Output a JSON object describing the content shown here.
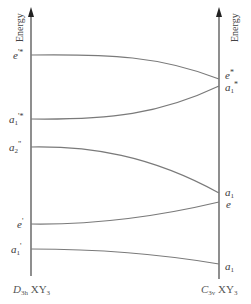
{
  "diagram": {
    "type": "correlation-diagram",
    "axis_title_left": "Energy",
    "axis_title_right": "Energy",
    "left_group": {
      "point_group": "D",
      "point_group_sub": "3h",
      "molecule": "XY",
      "molecule_sub": "3"
    },
    "right_group": {
      "point_group": "C",
      "point_group_sub": "3v",
      "molecule": "XY",
      "molecule_sub": "3"
    },
    "left_levels": [
      {
        "id": "e_prime_star",
        "base": "e",
        "sub": "",
        "sup": "'*",
        "y": 55
      },
      {
        "id": "a1_prime_star",
        "base": "a",
        "sub": "1",
        "sup": "'*",
        "y": 119
      },
      {
        "id": "a2_dprime",
        "base": "a",
        "sub": "2",
        "sup": "\"",
        "y": 147
      },
      {
        "id": "e_prime",
        "base": "e",
        "sub": "",
        "sup": "'",
        "y": 224
      },
      {
        "id": "a1_prime",
        "base": "a",
        "sub": "1",
        "sup": "'",
        "y": 249
      }
    ],
    "right_levels": [
      {
        "id": "e_star",
        "base": "e",
        "sub": "",
        "sup": "*",
        "y": 79
      },
      {
        "id": "a1_star",
        "base": "a",
        "sub": "1",
        "sup": "*",
        "y": 86
      },
      {
        "id": "a1_upper",
        "base": "a",
        "sub": "1",
        "sup": "",
        "y": 193
      },
      {
        "id": "e",
        "base": "e",
        "sub": "",
        "sup": "",
        "y": 202
      },
      {
        "id": "a1_lower",
        "base": "a",
        "sub": "1",
        "sup": "",
        "y": 264
      }
    ],
    "correlations": [
      {
        "from": "e_prime_star",
        "to": "e_star"
      },
      {
        "from": "a1_prime_star",
        "to": "a1_star"
      },
      {
        "from": "a2_dprime",
        "to": "a1_upper"
      },
      {
        "from": "e_prime",
        "to": "e"
      },
      {
        "from": "a1_prime",
        "to": "a1_lower"
      }
    ],
    "colors": {
      "axis": "#444444",
      "line": "#7a7a7a",
      "text": "#3a3a3a"
    }
  }
}
